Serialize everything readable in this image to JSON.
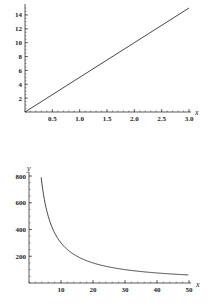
{
  "chart_data": [
    {
      "type": "line",
      "title": "",
      "xlabel": "x",
      "ylabel": "y",
      "function": "y = 5x",
      "x": [
        0,
        0.5,
        1.0,
        1.5,
        2.0,
        2.5,
        3.0
      ],
      "series": [
        {
          "name": "y",
          "values": [
            0,
            2.5,
            5,
            7.5,
            10,
            12.5,
            15
          ]
        }
      ],
      "xlim": [
        0,
        3.0
      ],
      "ylim": [
        0,
        15
      ],
      "xticks": [
        "0.5",
        "1.0",
        "1.5",
        "2.0",
        "2.5",
        "3.0"
      ],
      "yticks": [
        "2",
        "4",
        "6",
        "8",
        "10",
        "12",
        "14"
      ],
      "grid": false,
      "legend": null
    },
    {
      "type": "line",
      "title": "",
      "xlabel": "x",
      "ylabel": "y",
      "function": "y = 3000/x",
      "x": [
        3.8,
        5,
        10,
        20,
        30,
        40,
        50
      ],
      "series": [
        {
          "name": "y",
          "values": [
            790,
            600,
            300,
            150,
            100,
            75,
            60
          ]
        }
      ],
      "xlim": [
        0,
        50
      ],
      "ylim": [
        0,
        800
      ],
      "xticks": [
        "10",
        "20",
        "30",
        "40",
        "50"
      ],
      "yticks": [
        "200",
        "400",
        "600",
        "800"
      ],
      "grid": false,
      "legend": null
    }
  ]
}
